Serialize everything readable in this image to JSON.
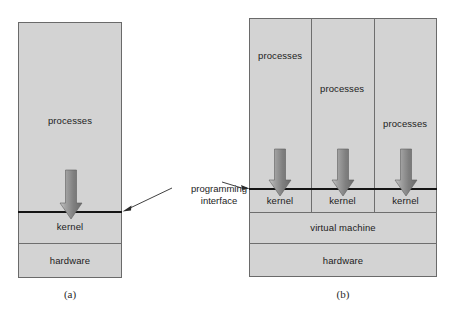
{
  "figure": {
    "annotation": {
      "line1": "programming",
      "line2": "interface"
    },
    "panel_a": {
      "caption": "(a)",
      "layers": [
        {
          "name": "processes",
          "label": "processes"
        },
        {
          "name": "kernel",
          "label": "kernel"
        },
        {
          "name": "hardware",
          "label": "hardware"
        }
      ],
      "arrow_count": 1
    },
    "panel_b": {
      "caption": "(b)",
      "columns": [
        {
          "processes_label": "processes",
          "kernel_label": "kernel"
        },
        {
          "processes_label": "processes",
          "kernel_label": "kernel"
        },
        {
          "processes_label": "processes",
          "kernel_label": "kernel"
        }
      ],
      "layers": [
        {
          "name": "virtual-machine",
          "label": "virtual machine"
        },
        {
          "name": "hardware",
          "label": "hardware"
        }
      ],
      "arrow_count": 3
    }
  },
  "colors": {
    "box_fill": "#d3d3d3",
    "box_border": "#6a6a6a",
    "interface_line": "#141414",
    "arrow_gray": "#8b8b8b",
    "page_background": "#ffffff"
  }
}
